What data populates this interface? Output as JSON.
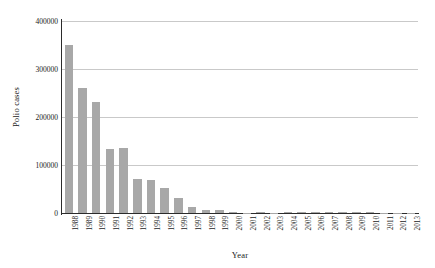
{
  "chart_data": {
    "type": "bar",
    "title": "",
    "subtitle": "",
    "xlabel": "Year",
    "ylabel": "Polio cases",
    "categories": [
      "1988",
      "1989",
      "1990",
      "1991",
      "1992",
      "1993",
      "1994",
      "1995",
      "1996",
      "1997",
      "1998",
      "1999",
      "2000",
      "2001",
      "2002",
      "2003",
      "2004",
      "2005",
      "2006",
      "2007",
      "2008",
      "2009",
      "2010",
      "2011",
      "2012",
      "2013"
    ],
    "values": [
      350000,
      260000,
      231000,
      133000,
      135000,
      71000,
      69000,
      52000,
      31000,
      13000,
      7000,
      7000,
      3000,
      500,
      1900,
      780,
      1260,
      1980,
      2000,
      1320,
      1650,
      1600,
      1350,
      650,
      220,
      400
    ],
    "series": [
      {
        "name": "Polio cases",
        "values": [
          350000,
          260000,
          231000,
          133000,
          135000,
          71000,
          69000,
          52000,
          31000,
          13000,
          7000,
          7000,
          3000,
          500,
          1900,
          780,
          1260,
          1980,
          2000,
          1320,
          1650,
          1600,
          1350,
          650,
          220,
          400
        ]
      }
    ],
    "ylim": [
      0,
      400000
    ],
    "yticks": [
      0,
      100000,
      200000,
      300000,
      400000
    ],
    "ytick_labels": [
      "0",
      "100000",
      "200000",
      "300000",
      "400000"
    ],
    "grid": "horizontal",
    "legend": "none",
    "bar_color": "#a8a8a8",
    "gridline_color": "#c9c9c9",
    "axis_color": "#2b2b2b"
  }
}
